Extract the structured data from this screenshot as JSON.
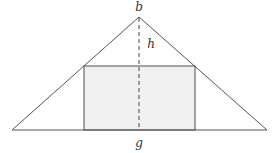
{
  "diagram": {
    "type": "geometry",
    "labels": {
      "apex": "b",
      "height": "h",
      "base_midpoint": "g"
    },
    "colors": {
      "stroke": "#555555",
      "rect_stroke": "#6b6b6b",
      "rect_fill": "#f0f0f0",
      "label": "#333333"
    },
    "triangle": {
      "apex": [
        139,
        17
      ],
      "base_left": [
        12,
        130
      ],
      "base_right": [
        267,
        130
      ]
    },
    "rectangle": {
      "x": 84,
      "y": 66,
      "width": 111,
      "height": 64
    },
    "altitude": {
      "x": 139,
      "y1": 17,
      "y2": 130,
      "style": "dashed"
    }
  }
}
